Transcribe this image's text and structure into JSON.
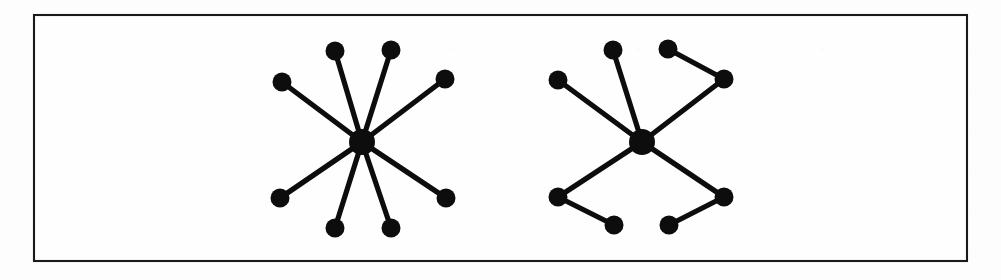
{
  "figure": {
    "caption": "",
    "background_color": "#fdfdfd",
    "border_color": "#1a1a1a",
    "node_color": "#0d0d0d",
    "edge_color": "#0d0d0d",
    "frame": {
      "x": 33,
      "y": 14,
      "width": 935,
      "height": 248
    }
  },
  "chart_data": {
    "type": "diagram",
    "title": "",
    "subtitle": "",
    "xlabel": "",
    "ylabel": "",
    "legend": [],
    "annotations": [],
    "graphs": [
      {
        "name": "left-graph",
        "label": "",
        "description": "star graph with one central hub and eight pendant leaves",
        "node_count": 9,
        "edge_count": 8,
        "hub_radius": 13,
        "leaf_radius": 9.5,
        "nodes": [
          {
            "id": "L-hub",
            "role": "hub",
            "x": 362,
            "y": 142,
            "r": 13
          },
          {
            "id": "L1",
            "role": "leaf",
            "x": 335,
            "y": 51,
            "r": 9.5
          },
          {
            "id": "L2",
            "role": "leaf",
            "x": 391,
            "y": 50,
            "r": 9.5
          },
          {
            "id": "L3",
            "role": "leaf",
            "x": 445,
            "y": 79,
            "r": 9.5
          },
          {
            "id": "L4",
            "role": "leaf",
            "x": 446,
            "y": 198,
            "r": 9.5
          },
          {
            "id": "L5",
            "role": "leaf",
            "x": 391,
            "y": 228,
            "r": 9.5
          },
          {
            "id": "L6",
            "role": "leaf",
            "x": 335,
            "y": 228,
            "r": 9.5
          },
          {
            "id": "L7",
            "role": "leaf",
            "x": 280,
            "y": 198,
            "r": 9.5
          },
          {
            "id": "L8",
            "role": "leaf",
            "x": 282,
            "y": 82,
            "r": 9.5
          }
        ],
        "edges": [
          {
            "from": "L-hub",
            "to": "L1"
          },
          {
            "from": "L-hub",
            "to": "L2"
          },
          {
            "from": "L-hub",
            "to": "L3"
          },
          {
            "from": "L-hub",
            "to": "L4"
          },
          {
            "from": "L-hub",
            "to": "L5"
          },
          {
            "from": "L-hub",
            "to": "L6"
          },
          {
            "from": "L-hub",
            "to": "L7"
          },
          {
            "from": "L-hub",
            "to": "L8"
          }
        ]
      },
      {
        "name": "right-graph",
        "label": "",
        "description": "spider graph: central hub of degree four, two branches are single leaves and two branches are paths of length two",
        "node_count": 9,
        "edge_count": 8,
        "hub_radius": 13,
        "leaf_radius": 9.5,
        "nodes": [
          {
            "id": "R-hub",
            "role": "hub",
            "x": 642,
            "y": 142,
            "r": 13
          },
          {
            "id": "R1",
            "role": "leaf",
            "x": 613,
            "y": 50,
            "r": 9.5
          },
          {
            "id": "R2",
            "role": "leaf",
            "x": 558,
            "y": 80,
            "r": 9.5
          },
          {
            "id": "R3",
            "role": "branch",
            "x": 724,
            "y": 79,
            "r": 9.5
          },
          {
            "id": "R4",
            "role": "leaf",
            "x": 668,
            "y": 49,
            "r": 9.5
          },
          {
            "id": "R5",
            "role": "branch",
            "x": 724,
            "y": 197,
            "r": 9.5
          },
          {
            "id": "R6",
            "role": "leaf",
            "x": 669,
            "y": 225,
            "r": 9.5
          },
          {
            "id": "R7",
            "role": "branch",
            "x": 558,
            "y": 197,
            "r": 9.5
          },
          {
            "id": "R8",
            "role": "leaf",
            "x": 614,
            "y": 225,
            "r": 9.5
          }
        ],
        "edges": [
          {
            "from": "R-hub",
            "to": "R1"
          },
          {
            "from": "R-hub",
            "to": "R2"
          },
          {
            "from": "R-hub",
            "to": "R3"
          },
          {
            "from": "R3",
            "to": "R4"
          },
          {
            "from": "R-hub",
            "to": "R5"
          },
          {
            "from": "R5",
            "to": "R6"
          },
          {
            "from": "R-hub",
            "to": "R7"
          },
          {
            "from": "R7",
            "to": "R8"
          }
        ]
      }
    ]
  }
}
